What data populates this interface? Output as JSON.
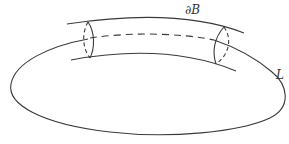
{
  "diagram": {
    "labels": {
      "boundary": "∂B",
      "curve": "L"
    },
    "colors": {
      "stroke": "#3a3a3a",
      "background": "#ffffff"
    }
  }
}
